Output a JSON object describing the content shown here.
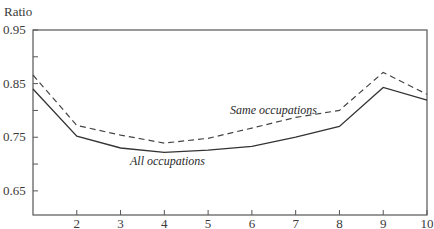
{
  "chart_data": {
    "type": "line",
    "title": "",
    "xlabel": "",
    "ylabel": "Ratio",
    "x": [
      1,
      2,
      3,
      4,
      5,
      6,
      7,
      8,
      9,
      10
    ],
    "xlim": [
      1,
      10
    ],
    "ylim": [
      0.605,
      0.95
    ],
    "x_ticks": [
      "2",
      "3",
      "4",
      "5",
      "6",
      "7",
      "8",
      "9",
      "10"
    ],
    "y_ticks": [
      "0.95",
      "0.85",
      "0.75",
      "0.65"
    ],
    "y_minor_ticks": [
      0.9,
      0.8,
      0.7
    ],
    "grid": false,
    "legend": "inline labels",
    "series": [
      {
        "name": "All occupations",
        "style": "solid",
        "values": [
          0.84,
          0.752,
          0.73,
          0.722,
          0.726,
          0.733,
          0.75,
          0.77,
          0.843,
          0.819
        ]
      },
      {
        "name": "Same occupations",
        "style": "dashed",
        "values": [
          0.866,
          0.772,
          0.754,
          0.739,
          0.748,
          0.767,
          0.787,
          0.8,
          0.871,
          0.83
        ]
      }
    ]
  },
  "labels": {
    "y_axis_title": "Ratio",
    "series_all": "All occupations",
    "series_same": "Same occupations"
  },
  "colors": {
    "axis": "#555555",
    "line": "#333333"
  }
}
